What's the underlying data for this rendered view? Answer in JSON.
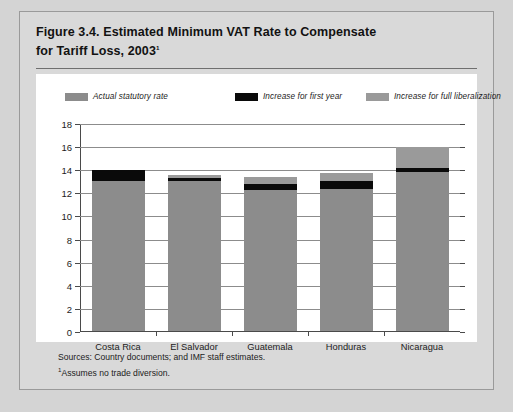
{
  "figure": {
    "title_line1": "Figure 3.4.  Estimated Minimum VAT Rate to Compensate",
    "title_line2": "for Tariff Loss, 2003",
    "title_footnote_marker": "1"
  },
  "notes": {
    "sources": "Sources: Country documents; and IMF staff estimates.",
    "assumes": "Assumes no trade diversion.",
    "assumes_marker": "1"
  },
  "colors": {
    "page_background": "#d4d4d4",
    "panel_background": "#d9d9d9",
    "plot_background": "#ffffff",
    "actual_statutory_rate": "#8c8c8c",
    "increase_first_year": "#0a0a0a",
    "increase_full_liberalization": "#9a9a9a",
    "gridline": "#8c8c8c",
    "axis": "#4a4a4a",
    "text": "#1c1c1c"
  },
  "chart_data": {
    "type": "bar",
    "subtype": "stacked",
    "title": "Figure 3.4.  Estimated Minimum VAT Rate to Compensate for Tariff Loss, 2003",
    "xlabel": "",
    "ylabel": "",
    "ylim": [
      0,
      18
    ],
    "ytick_step": 2,
    "yticks": [
      0,
      2,
      4,
      6,
      8,
      10,
      12,
      14,
      16,
      18
    ],
    "ytick_labels": [
      "0",
      "2",
      "4",
      "6",
      "8",
      "10",
      "12",
      "14",
      "16",
      "18"
    ],
    "grid": true,
    "legend_position": "top",
    "categories": [
      "Costa Rica",
      "El Salvador",
      "Guatemala",
      "Honduras",
      "Nicaragua"
    ],
    "series": [
      {
        "name": "Actual statutory rate",
        "color": "#8c8c8c",
        "values": [
          13.0,
          13.0,
          12.2,
          12.3,
          13.8
        ]
      },
      {
        "name": "Increase for first year",
        "color": "#0a0a0a",
        "values": [
          0.9,
          0.25,
          0.55,
          0.7,
          0.35
        ]
      },
      {
        "name": "Increase for full liberalization",
        "color": "#9a9a9a",
        "values": [
          0.0,
          0.25,
          0.55,
          0.7,
          1.75
        ]
      }
    ],
    "totals": [
      13.9,
      13.5,
      13.3,
      13.7,
      15.9
    ]
  },
  "legend": {
    "entries": [
      {
        "label": "Actual statutory rate",
        "color": "#8c8c8c"
      },
      {
        "label": "Increase for first year",
        "color": "#0a0a0a"
      },
      {
        "label": "Increase for full liberalization",
        "color": "#9a9a9a"
      }
    ]
  }
}
